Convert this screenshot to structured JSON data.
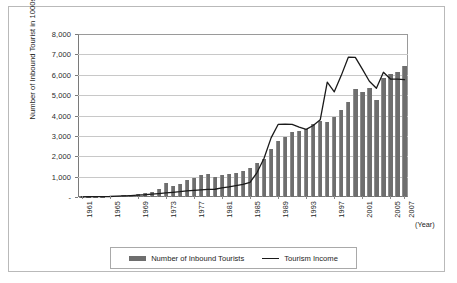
{
  "chart_data": {
    "type": "bar",
    "title": "",
    "subtitle": "",
    "xlabel": "(Year)",
    "ylabel": "Number of Inbound Tourist in 1000s",
    "ylim": [
      0,
      8000
    ],
    "ytick_labels": [
      "-",
      "1,000",
      "2,000",
      "3,000",
      "4,000",
      "5,000",
      "6,000",
      "7,000",
      "8,000"
    ],
    "ytick_values": [
      0,
      1000,
      2000,
      3000,
      4000,
      5000,
      6000,
      7000,
      8000
    ],
    "grid": true,
    "legend_position": "bottom",
    "x": [
      1961,
      1962,
      1963,
      1964,
      1965,
      1966,
      1967,
      1968,
      1969,
      1970,
      1971,
      1972,
      1973,
      1974,
      1975,
      1976,
      1977,
      1978,
      1979,
      1980,
      1981,
      1982,
      1983,
      1984,
      1985,
      1986,
      1987,
      1988,
      1989,
      1990,
      1991,
      1992,
      1993,
      1994,
      1995,
      1996,
      1997,
      1998,
      1999,
      2000,
      2001,
      2002,
      2003,
      2004,
      2005,
      2006,
      2007
    ],
    "xtick_labels": [
      "1961",
      "1965",
      "1969",
      "1973",
      "1977",
      "1981",
      "1985",
      "1989",
      "1993",
      "1997",
      "2001",
      "2005",
      "2007"
    ],
    "xtick_values": [
      1961,
      1965,
      1969,
      1973,
      1977,
      1981,
      1985,
      1989,
      1993,
      1997,
      2001,
      2005,
      2007
    ],
    "series": [
      {
        "name": "Number of Inbound Tourists",
        "type": "bar",
        "color": "#6e6e6e",
        "values": [
          11,
          15,
          20,
          25,
          33,
          67,
          84,
          102,
          126,
          173,
          233,
          371,
          679,
          517,
          633,
          834,
          949,
          1079,
          1126,
          976,
          1093,
          1145,
          1194,
          1298,
          1426,
          1660,
          1875,
          2340,
          2728,
          2959,
          3196,
          3231,
          3331,
          3580,
          3753,
          3684,
          3908,
          4250,
          4660,
          5322,
          5147,
          5347,
          4753,
          5818,
          6023,
          6155,
          6448
        ]
      },
      {
        "name": "Tourism Income",
        "type": "line",
        "color": "#1a1a1a",
        "values": [
          10,
          12,
          16,
          20,
          25,
          40,
          55,
          70,
          90,
          110,
          140,
          170,
          200,
          230,
          260,
          300,
          330,
          350,
          370,
          380,
          450,
          500,
          560,
          620,
          720,
          1200,
          1900,
          2900,
          3560,
          3570,
          3560,
          3430,
          3320,
          3510,
          3790,
          5640,
          5160,
          5970,
          6860,
          6850,
          6280,
          5680,
          5340,
          6120,
          5790,
          5790,
          5760
        ]
      }
    ]
  },
  "legend": {
    "items": [
      {
        "label": "Number of Inbound Tourists",
        "marker": "bar-swatch"
      },
      {
        "label": "Tourism Income",
        "marker": "line-swatch"
      }
    ]
  },
  "axis_titles": {
    "y": "Number of Inbound Tourist in 1000s",
    "x": "(Year)"
  }
}
